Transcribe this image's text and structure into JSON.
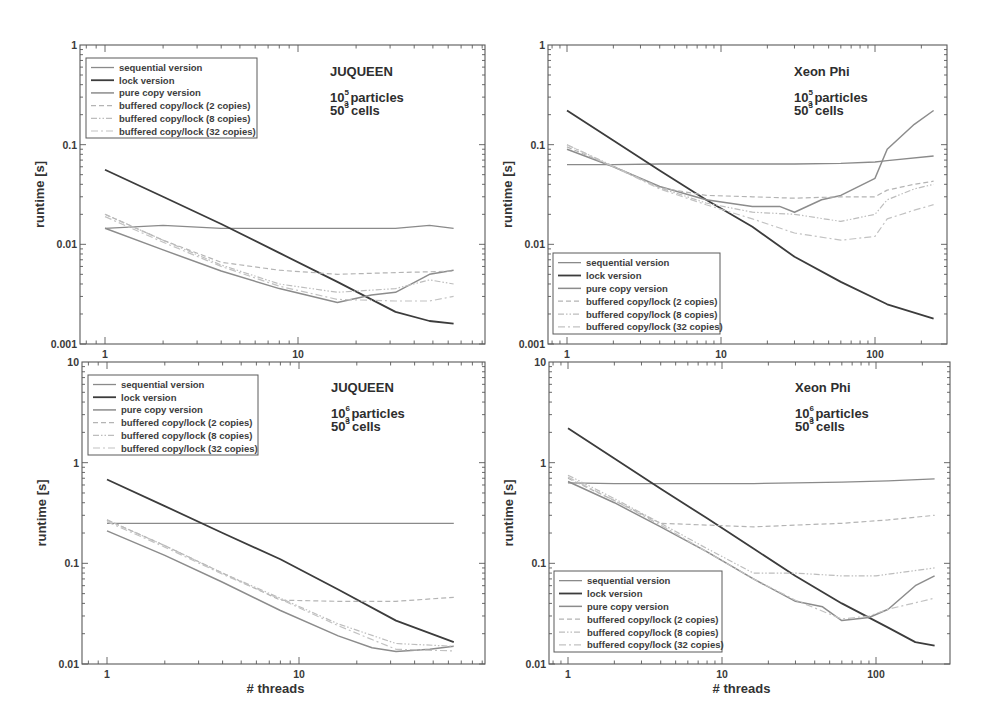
{
  "figure": {
    "x_axis_label": "# threads",
    "y_axis_label": "runtime [s]"
  },
  "legend_entries": [
    "sequential version",
    "lock version",
    "pure copy version",
    "buffered copy/lock (2 copies)",
    "buffered copy/lock (8 copies)",
    "buffered copy/lock (32 copies)"
  ],
  "series_styles": [
    {
      "name": "sequential version",
      "color": "#8a8a8a",
      "width": 1.3,
      "dash": ""
    },
    {
      "name": "lock version",
      "color": "#3c3c3c",
      "width": 1.8,
      "dash": ""
    },
    {
      "name": "pure copy version",
      "color": "#8c8c8c",
      "width": 1.5,
      "dash": ""
    },
    {
      "name": "buffered copy/lock (2 copies)",
      "color": "#b4b4b4",
      "width": 1.2,
      "dash": "5,3"
    },
    {
      "name": "buffered copy/lock (8 copies)",
      "color": "#bdbdbd",
      "width": 1.2,
      "dash": "6,2,1.5,2,1.5,2"
    },
    {
      "name": "buffered copy/lock (32 copies)",
      "color": "#c2c2c2",
      "width": 1.2,
      "dash": "7,3,2,3"
    }
  ],
  "chart_data": [
    {
      "id": "juqueen-1e5",
      "type": "line",
      "title": "JUQUEEN",
      "subtitle": [
        "10^5_3 particles",
        "50^3 cells"
      ],
      "annotation": {
        "machine": "JUQUEEN",
        "particles_base": "10",
        "particles_exp": "5",
        "particles_sub": "3",
        "particles_text": "particles",
        "cells_base": "50",
        "cells_exp": "3",
        "cells_text": "cells"
      },
      "xlabel": "",
      "ylabel": "runtime [s]",
      "xscale": "log",
      "yscale": "log",
      "xlim": [
        0.75,
        100
      ],
      "ylim": [
        0.001,
        1
      ],
      "xticks": [
        1,
        10
      ],
      "xtick_labels": [
        "1",
        "10"
      ],
      "yticks": [
        0.001,
        0.01,
        0.1,
        1
      ],
      "ytick_labels": [
        "0.001",
        "0.01",
        "0.1",
        "1"
      ],
      "grid": false,
      "legend_position": "upper left",
      "frame": {
        "left": 80,
        "top": 45,
        "right": 485,
        "bottom": 344
      },
      "x_anchor": {
        "x1": 105,
        "px_per_decade": 193
      },
      "legend_box": {
        "x": 86,
        "y": 58,
        "w": 171,
        "h": 80
      },
      "annot_pos": {
        "x": 330,
        "y": 76
      },
      "series": [
        {
          "name": "sequential version",
          "x": [
            1,
            2,
            4,
            8,
            16,
            32,
            48,
            64
          ],
          "values": [
            0.0145,
            0.0155,
            0.0145,
            0.0145,
            0.0145,
            0.0145,
            0.0155,
            0.0145
          ]
        },
        {
          "name": "lock version",
          "x": [
            1,
            2,
            4,
            8,
            16,
            32,
            48,
            64
          ],
          "values": [
            0.056,
            0.03,
            0.016,
            0.0082,
            0.0042,
            0.0021,
            0.0017,
            0.0016
          ]
        },
        {
          "name": "pure copy version",
          "x": [
            1,
            2,
            4,
            8,
            16,
            24,
            32,
            48,
            64
          ],
          "values": [
            0.0145,
            0.0088,
            0.0054,
            0.0036,
            0.0026,
            0.0031,
            0.0033,
            0.005,
            0.0055
          ]
        },
        {
          "name": "buffered copy/lock (2 copies)",
          "x": [
            1,
            2,
            4,
            8,
            16,
            32,
            48,
            64
          ],
          "values": [
            0.02,
            0.011,
            0.0066,
            0.0055,
            0.005,
            0.0052,
            0.0053,
            0.0054
          ]
        },
        {
          "name": "buffered copy/lock (8 copies)",
          "x": [
            1,
            2,
            4,
            8,
            16,
            32,
            48,
            64
          ],
          "values": [
            0.02,
            0.011,
            0.0062,
            0.004,
            0.0033,
            0.0036,
            0.0044,
            0.004
          ]
        },
        {
          "name": "buffered copy/lock (32 copies)",
          "x": [
            1,
            2,
            4,
            8,
            16,
            32,
            48,
            64
          ],
          "values": [
            0.019,
            0.0105,
            0.006,
            0.0038,
            0.0028,
            0.0027,
            0.0027,
            0.003
          ]
        }
      ]
    },
    {
      "id": "xeonphi-1e5",
      "type": "line",
      "title": "Xeon Phi",
      "subtitle": [
        "10^5_3 particles",
        "50^3 cells"
      ],
      "annotation": {
        "machine": "Xeon Phi",
        "particles_base": "10",
        "particles_exp": "5",
        "particles_sub": "3",
        "particles_text": "particles",
        "cells_base": "50",
        "cells_exp": "3",
        "cells_text": "cells"
      },
      "xlabel": "",
      "ylabel": "runtime [s]",
      "xscale": "log",
      "yscale": "log",
      "xlim": [
        0.76,
        400
      ],
      "ylim": [
        0.001,
        1
      ],
      "xticks": [
        1,
        10,
        100
      ],
      "xtick_labels": [
        "1",
        "10",
        "100"
      ],
      "yticks": [
        0.001,
        0.01,
        0.1,
        1
      ],
      "ytick_labels": [
        "0.001",
        "0.01",
        "0.1",
        "1"
      ],
      "grid": false,
      "legend_position": "lower left",
      "frame": {
        "left": 548,
        "top": 45,
        "right": 947,
        "bottom": 344
      },
      "x_anchor": {
        "x1": 567,
        "px_per_decade": 154
      },
      "legend_box": {
        "x": 553,
        "y": 253,
        "w": 167,
        "h": 81
      },
      "annot_pos": {
        "x": 794,
        "y": 76
      },
      "series": [
        {
          "name": "sequential version",
          "x": [
            1,
            2,
            4,
            8,
            16,
            30,
            60,
            100,
            120,
            240
          ],
          "values": [
            0.063,
            0.063,
            0.064,
            0.064,
            0.064,
            0.064,
            0.065,
            0.067,
            0.069,
            0.077
          ]
        },
        {
          "name": "lock version",
          "x": [
            1,
            2,
            4,
            8,
            16,
            30,
            60,
            120,
            240
          ],
          "values": [
            0.22,
            0.11,
            0.055,
            0.028,
            0.015,
            0.0075,
            0.0042,
            0.0025,
            0.0018
          ]
        },
        {
          "name": "pure copy version",
          "x": [
            1,
            2,
            4,
            8,
            16,
            24,
            30,
            45,
            60,
            100,
            120,
            180,
            240
          ],
          "values": [
            0.09,
            0.06,
            0.038,
            0.028,
            0.024,
            0.024,
            0.021,
            0.028,
            0.031,
            0.046,
            0.09,
            0.16,
            0.22
          ]
        },
        {
          "name": "buffered copy/lock (2 copies)",
          "x": [
            1,
            2,
            4,
            8,
            16,
            30,
            60,
            100,
            120,
            180,
            240
          ],
          "values": [
            0.095,
            0.06,
            0.037,
            0.031,
            0.03,
            0.029,
            0.03,
            0.03,
            0.035,
            0.04,
            0.043
          ]
        },
        {
          "name": "buffered copy/lock (8 copies)",
          "x": [
            1,
            2,
            4,
            8,
            16,
            30,
            60,
            100,
            120,
            180,
            240
          ],
          "values": [
            0.1,
            0.061,
            0.037,
            0.026,
            0.021,
            0.02,
            0.017,
            0.02,
            0.028,
            0.036,
            0.04
          ]
        },
        {
          "name": "buffered copy/lock (32 copies)",
          "x": [
            1,
            2,
            4,
            8,
            16,
            30,
            60,
            100,
            120,
            180,
            240
          ],
          "values": [
            0.1,
            0.06,
            0.036,
            0.025,
            0.018,
            0.013,
            0.011,
            0.012,
            0.018,
            0.022,
            0.025
          ]
        }
      ]
    },
    {
      "id": "juqueen-1e6",
      "type": "line",
      "title": "JUQUEEN",
      "subtitle": [
        "10^6_3 particles",
        "50^3 cells"
      ],
      "annotation": {
        "machine": "JUQUEEN",
        "particles_base": "10",
        "particles_exp": "6",
        "particles_sub": "3",
        "particles_text": "particles",
        "cells_base": "50",
        "cells_exp": "3",
        "cells_text": "cells"
      },
      "xlabel": "# threads",
      "ylabel": "runtime [s]",
      "xscale": "log",
      "yscale": "log",
      "xlim": [
        0.75,
        100
      ],
      "ylim": [
        0.01,
        10
      ],
      "xticks": [
        1,
        10
      ],
      "xtick_labels": [
        "1",
        "10"
      ],
      "yticks": [
        0.01,
        0.1,
        1,
        10
      ],
      "ytick_labels": [
        "0.01",
        "0.1",
        "1",
        "10"
      ],
      "grid": false,
      "legend_position": "upper left",
      "frame": {
        "left": 82,
        "top": 362,
        "right": 485,
        "bottom": 664
      },
      "x_anchor": {
        "x1": 107,
        "px_per_decade": 192
      },
      "legend_box": {
        "x": 88,
        "y": 375,
        "w": 170,
        "h": 80
      },
      "annot_pos": {
        "x": 331,
        "y": 392
      },
      "series": [
        {
          "name": "sequential version",
          "x": [
            1,
            2,
            4,
            8,
            16,
            32,
            64
          ],
          "values": [
            0.25,
            0.25,
            0.25,
            0.25,
            0.25,
            0.25,
            0.25
          ]
        },
        {
          "name": "lock version",
          "x": [
            1,
            2,
            4,
            8,
            16,
            32,
            64
          ],
          "values": [
            0.68,
            0.37,
            0.2,
            0.11,
            0.055,
            0.027,
            0.0165
          ]
        },
        {
          "name": "pure copy version",
          "x": [
            1,
            2,
            4,
            8,
            16,
            24,
            32,
            48,
            64
          ],
          "values": [
            0.21,
            0.12,
            0.065,
            0.034,
            0.019,
            0.0145,
            0.0133,
            0.014,
            0.015
          ]
        },
        {
          "name": "buffered copy/lock (2 copies)",
          "x": [
            1,
            2,
            4,
            8,
            16,
            32,
            64
          ],
          "values": [
            0.27,
            0.15,
            0.08,
            0.043,
            0.042,
            0.042,
            0.046
          ]
        },
        {
          "name": "buffered copy/lock (8 copies)",
          "x": [
            1,
            2,
            4,
            8,
            16,
            32,
            64
          ],
          "values": [
            0.27,
            0.15,
            0.08,
            0.045,
            0.025,
            0.016,
            0.015
          ]
        },
        {
          "name": "buffered copy/lock (32 copies)",
          "x": [
            1,
            2,
            4,
            8,
            16,
            32,
            64
          ],
          "values": [
            0.26,
            0.145,
            0.078,
            0.044,
            0.024,
            0.014,
            0.0135
          ]
        }
      ]
    },
    {
      "id": "xeonphi-1e6",
      "type": "line",
      "title": "Xeon Phi",
      "subtitle": [
        "10^6_3 particles",
        "50^3 cells"
      ],
      "annotation": {
        "machine": "Xeon Phi",
        "particles_base": "10",
        "particles_exp": "6",
        "particles_sub": "3",
        "particles_text": "particles",
        "cells_base": "50",
        "cells_exp": "3",
        "cells_text": "cells"
      },
      "xlabel": "# threads",
      "ylabel": "runtime [s]",
      "xscale": "log",
      "yscale": "log",
      "xlim": [
        0.76,
        400
      ],
      "ylim": [
        0.01,
        10
      ],
      "xticks": [
        1,
        10,
        100
      ],
      "xtick_labels": [
        "1",
        "10",
        "100"
      ],
      "yticks": [
        0.01,
        0.1,
        1,
        10
      ],
      "ytick_labels": [
        "0.01",
        "0.1",
        "1",
        "10"
      ],
      "grid": false,
      "legend_position": "lower left",
      "frame": {
        "left": 549,
        "top": 362,
        "right": 950,
        "bottom": 664
      },
      "x_anchor": {
        "x1": 568,
        "px_per_decade": 154
      },
      "legend_box": {
        "x": 554,
        "y": 571,
        "w": 168,
        "h": 81
      },
      "annot_pos": {
        "x": 795,
        "y": 392
      },
      "series": [
        {
          "name": "sequential version",
          "x": [
            1,
            2,
            4,
            8,
            16,
            30,
            60,
            120,
            240
          ],
          "values": [
            0.63,
            0.62,
            0.62,
            0.62,
            0.62,
            0.63,
            0.64,
            0.66,
            0.69
          ]
        },
        {
          "name": "lock version",
          "x": [
            1,
            2,
            4,
            8,
            16,
            30,
            60,
            120,
            180,
            240
          ],
          "values": [
            2.2,
            1.1,
            0.55,
            0.28,
            0.14,
            0.075,
            0.04,
            0.023,
            0.0165,
            0.0152
          ]
        },
        {
          "name": "pure copy version",
          "x": [
            1,
            2,
            4,
            8,
            16,
            30,
            45,
            60,
            90,
            120,
            180,
            240
          ],
          "values": [
            0.65,
            0.4,
            0.23,
            0.13,
            0.07,
            0.042,
            0.037,
            0.027,
            0.029,
            0.035,
            0.06,
            0.075
          ]
        },
        {
          "name": "buffered copy/lock (2 copies)",
          "x": [
            1,
            2,
            4,
            8,
            16,
            30,
            60,
            120,
            240
          ],
          "values": [
            0.7,
            0.42,
            0.25,
            0.24,
            0.23,
            0.24,
            0.25,
            0.27,
            0.3
          ]
        },
        {
          "name": "buffered copy/lock (8 copies)",
          "x": [
            1,
            2,
            4,
            8,
            16,
            30,
            60,
            100,
            240
          ],
          "values": [
            0.75,
            0.44,
            0.25,
            0.14,
            0.08,
            0.08,
            0.075,
            0.075,
            0.09
          ]
        },
        {
          "name": "buffered copy/lock (32 copies)",
          "x": [
            1,
            2,
            4,
            8,
            16,
            30,
            60,
            90,
            120,
            240
          ],
          "values": [
            0.72,
            0.42,
            0.24,
            0.13,
            0.07,
            0.043,
            0.028,
            0.03,
            0.035,
            0.045
          ]
        }
      ]
    }
  ]
}
